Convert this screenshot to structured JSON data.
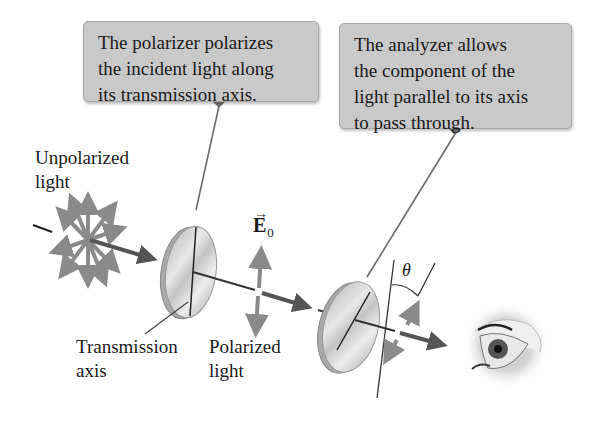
{
  "callouts": {
    "polarizer": {
      "lines": [
        "The polarizer polarizes",
        "the incident light along",
        "its transmission axis."
      ]
    },
    "analyzer": {
      "lines": [
        "The analyzer allows",
        "the component of the",
        "light parallel to its axis",
        "to pass through."
      ]
    }
  },
  "labels": {
    "unpolarized": [
      "Unpolarized",
      "light"
    ],
    "transmission_axis": [
      "Transmission",
      "axis"
    ],
    "polarized": [
      "Polarized",
      "light"
    ],
    "field_symbol": "E",
    "field_vector_mark": "→",
    "field_subscript": "0",
    "angle_symbol": "θ"
  },
  "colors": {
    "callout_bg": "#c9c9c9",
    "arrow_gray": "#8a8a8a",
    "beam_dark": "#555555",
    "line_dark": "#333333",
    "disk_light": "#d8d8d8",
    "text": "#1a1a1a"
  }
}
